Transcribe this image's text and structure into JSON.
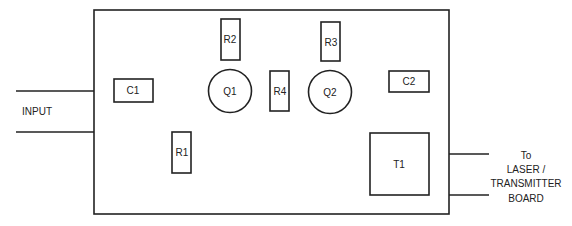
{
  "diagram": {
    "input_label": "INPUT",
    "output_label": [
      "To",
      "LASER /",
      "TRANSMITTER",
      "BOARD"
    ],
    "components": {
      "C1": "C1",
      "C2": "C2",
      "R1": "R1",
      "R2": "R2",
      "R3": "R3",
      "R4": "R4",
      "Q1": "Q1",
      "Q2": "Q2",
      "T1": "T1"
    }
  }
}
